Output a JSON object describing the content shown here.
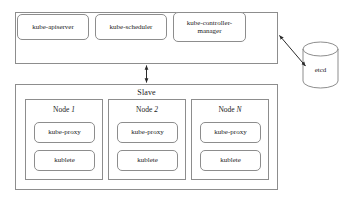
{
  "diagram": {
    "background_color": "#ffffff",
    "line_color": "#8d8d8d",
    "text_color": "#1a1a1a",
    "groups": [
      {
        "id": "master",
        "label": "Master",
        "components": [
          {
            "id": "kube-apiserver",
            "label": "kube-apiserver"
          },
          {
            "id": "kube-scheduler",
            "label": "kube-scheduler"
          },
          {
            "id": "kube-controller-manager",
            "label": "kube-controller-manager"
          }
        ]
      },
      {
        "id": "slave",
        "label": "Slave",
        "nodes": [
          {
            "id": "node-1",
            "label_prefix": "Node ",
            "label_name": "1",
            "components": [
              {
                "id": "kube-proxy",
                "label": "kube-proxy"
              },
              {
                "id": "kublete",
                "label": "kublete"
              }
            ]
          },
          {
            "id": "node-2",
            "label_prefix": "Node ",
            "label_name": "2",
            "components": [
              {
                "id": "kube-proxy",
                "label": "kube-proxy"
              },
              {
                "id": "kublete",
                "label": "kublete"
              }
            ]
          },
          {
            "id": "node-n",
            "label_prefix": "Node ",
            "label_name": "N",
            "components": [
              {
                "id": "kube-proxy",
                "label": "kube-proxy"
              },
              {
                "id": "kublete",
                "label": "kublete"
              }
            ]
          }
        ]
      }
    ],
    "datastore": {
      "id": "etcd",
      "label": "etcd",
      "shape": "cylinder"
    },
    "connectors": [
      {
        "id": "master-slave",
        "from": "master",
        "to": "slave",
        "style": "double-arrow",
        "orientation": "vertical"
      },
      {
        "id": "master-etcd",
        "from": "master",
        "to": "etcd",
        "style": "double-arrow",
        "orientation": "diagonal"
      }
    ]
  }
}
